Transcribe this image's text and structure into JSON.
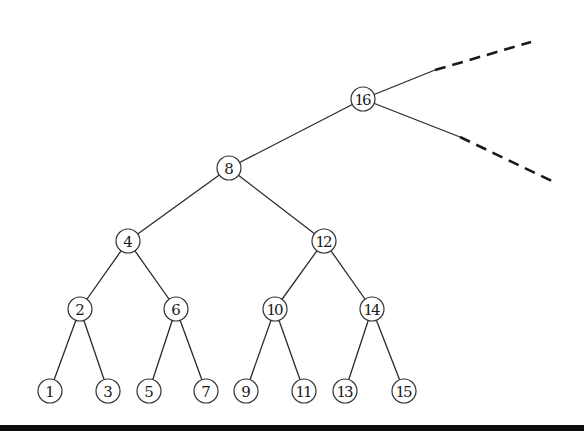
{
  "diagram": {
    "type": "binary-tree",
    "root": "16",
    "node_radius": 12,
    "nodes": [
      {
        "id": "16",
        "label": "16",
        "x": 363,
        "y": 99
      },
      {
        "id": "8",
        "label": "8",
        "x": 229,
        "y": 168
      },
      {
        "id": "4",
        "label": "4",
        "x": 128,
        "y": 241
      },
      {
        "id": "12",
        "label": "12",
        "x": 324,
        "y": 241
      },
      {
        "id": "2",
        "label": "2",
        "x": 80,
        "y": 309
      },
      {
        "id": "6",
        "label": "6",
        "x": 176,
        "y": 309
      },
      {
        "id": "10",
        "label": "10",
        "x": 275,
        "y": 309
      },
      {
        "id": "14",
        "label": "14",
        "x": 372,
        "y": 309
      },
      {
        "id": "1",
        "label": "1",
        "x": 50,
        "y": 391
      },
      {
        "id": "3",
        "label": "3",
        "x": 108,
        "y": 391
      },
      {
        "id": "5",
        "label": "5",
        "x": 149,
        "y": 391
      },
      {
        "id": "7",
        "label": "7",
        "x": 206,
        "y": 391
      },
      {
        "id": "9",
        "label": "9",
        "x": 246,
        "y": 391
      },
      {
        "id": "11",
        "label": "11",
        "x": 304,
        "y": 391
      },
      {
        "id": "13",
        "label": "13",
        "x": 345,
        "y": 391
      },
      {
        "id": "15",
        "label": "15",
        "x": 404,
        "y": 391
      }
    ],
    "edges": [
      {
        "from": "16",
        "to": "8"
      },
      {
        "from": "8",
        "to": "4"
      },
      {
        "from": "8",
        "to": "12"
      },
      {
        "from": "4",
        "to": "2"
      },
      {
        "from": "4",
        "to": "6"
      },
      {
        "from": "12",
        "to": "10"
      },
      {
        "from": "12",
        "to": "14"
      },
      {
        "from": "2",
        "to": "1"
      },
      {
        "from": "2",
        "to": "3"
      },
      {
        "from": "6",
        "to": "5"
      },
      {
        "from": "6",
        "to": "7"
      },
      {
        "from": "10",
        "to": "9"
      },
      {
        "from": "10",
        "to": "11"
      },
      {
        "from": "14",
        "to": "13"
      },
      {
        "from": "14",
        "to": "15"
      }
    ],
    "continuations": [
      {
        "name": "upper-continuation",
        "solid_to": [
          435,
          70
        ],
        "dashed_to": [
          531,
          42
        ]
      },
      {
        "name": "lower-continuation",
        "solid_to": [
          460,
          137
        ],
        "dashed_to": [
          556,
          183
        ]
      }
    ],
    "colors": {
      "stroke": "#2a2a2a",
      "node_fill": "#ffffff",
      "text": "#1a1a1a",
      "bottom_bar": "#0d0d0d"
    }
  }
}
